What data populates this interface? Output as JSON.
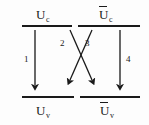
{
  "figure": {
    "background_color": "#fdfdfd",
    "ink_color": "#1a1a1a",
    "width": 149,
    "height": 125
  },
  "levels": [
    {
      "id": "upper-left",
      "symbol": "U",
      "subscript": "c",
      "overbar": false,
      "label_text": "Uc",
      "position": "top-left"
    },
    {
      "id": "upper-right",
      "symbol": "U",
      "subscript": "c",
      "overbar": true,
      "label_text": "Uc",
      "position": "top-right"
    },
    {
      "id": "lower-left",
      "symbol": "U",
      "subscript": "v",
      "overbar": false,
      "label_text": "Uv",
      "position": "bottom-left"
    },
    {
      "id": "lower-right",
      "symbol": "U",
      "subscript": "v",
      "overbar": true,
      "label_text": "Uv",
      "position": "bottom-right"
    }
  ],
  "transitions": [
    {
      "number": "1",
      "from": "upper-left",
      "to": "lower-left",
      "kind": "vertical"
    },
    {
      "number": "2",
      "from": "upper-right",
      "to": "lower-left",
      "kind": "diagonal"
    },
    {
      "number": "3",
      "from": "upper-left",
      "to": "lower-right",
      "kind": "diagonal"
    },
    {
      "number": "4",
      "from": "upper-right",
      "to": "lower-right",
      "kind": "vertical"
    }
  ]
}
